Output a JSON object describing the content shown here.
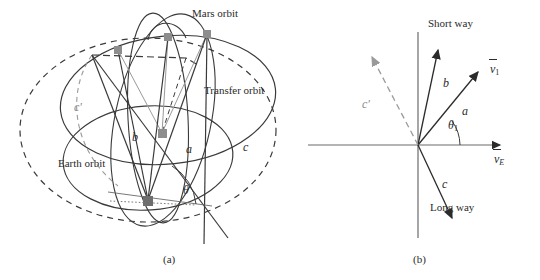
{
  "figure": {
    "background_color": "#ffffff",
    "ink_color": "#2b2b2b",
    "accent_gray": "#8a8a8a",
    "node_color": "#7d7d7d"
  },
  "panel_a": {
    "caption": "(a)",
    "labels": {
      "mars_orbit": "Mars orbit",
      "transfer_orbit": "Transfer orbit",
      "earth_orbit": "Earth orbit",
      "leg_a": "a",
      "leg_b": "b",
      "leg_c": "c",
      "leg_c_prime": "c'",
      "angle_theta": "θ"
    }
  },
  "panel_b": {
    "caption": "(b)",
    "labels": {
      "short_way": "Short way",
      "long_way": "Long way",
      "leg_a": "a",
      "leg_b": "b",
      "leg_c": "c",
      "leg_c_prime": "c'",
      "angle_theta": "θ",
      "angle_theta_sub": "1",
      "axis_vertical_symbol": "v",
      "axis_v1_symbol": "v",
      "axis_v1_sub": "1",
      "axis_ve_symbol": "v",
      "axis_ve_sub": "E"
    }
  }
}
